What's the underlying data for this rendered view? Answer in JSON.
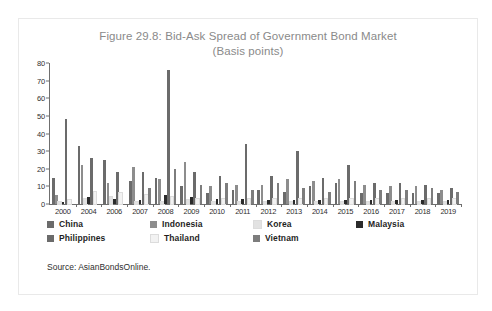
{
  "figure": {
    "title_line1": "Figure 29.8: Bid-Ask Spread of Government Bond Market",
    "title_line2": "(Basis points)",
    "source": "Source: AsianBondsOnline."
  },
  "legend": {
    "rows": [
      [
        {
          "label": "China",
          "color": "#6b6b6b"
        },
        {
          "label": "Indonesia",
          "color": "#8d8d8d"
        },
        {
          "label": "Korea",
          "color": "#e2e2e2"
        },
        {
          "label": "Malaysia",
          "color": "#2b2b2b"
        }
      ],
      [
        {
          "label": "Philippines",
          "color": "#6b6b6b"
        },
        {
          "label": "Thailand",
          "color": "#f2f2f2"
        },
        {
          "label": "Vietnam",
          "color": "#7d7d7d"
        }
      ]
    ]
  },
  "chart_data": {
    "type": "bar",
    "title": "Figure 29.8: Bid-Ask Spread of Government Bond Market (Basis points)",
    "xlabel": "",
    "ylabel": "Basis points",
    "ylim": [
      0,
      80
    ],
    "yticks": [
      0,
      10,
      20,
      30,
      40,
      50,
      60,
      70,
      80
    ],
    "grid": false,
    "legend_position": "below",
    "categories": [
      "2000",
      "2004",
      "2006",
      "2007",
      "2008",
      "2009",
      "2010",
      "2011",
      "2012",
      "2013",
      "2014",
      "2015",
      "2016",
      "2017",
      "2018",
      "2019"
    ],
    "series": [
      {
        "name": "China",
        "color": "#6b6b6b",
        "values": [
          15,
          33,
          25,
          13,
          15,
          10,
          6,
          8,
          8,
          7,
          10,
          12,
          6,
          6,
          6,
          6
        ]
      },
      {
        "name": "Indonesia",
        "color": "#8d8d8d",
        "values": [
          5,
          22,
          12,
          21,
          14,
          24,
          10,
          11,
          11,
          14,
          13,
          14,
          11,
          10,
          10,
          8
        ]
      },
      {
        "name": "Korea",
        "color": "#e2e2e2",
        "values": [
          1,
          3,
          4,
          1,
          1,
          2,
          1,
          1,
          1,
          1,
          1,
          1,
          1,
          1,
          1,
          1
        ]
      },
      {
        "name": "Malaysia",
        "color": "#2b2b2b",
        "values": [
          1,
          4,
          3,
          2,
          5,
          4,
          3,
          3,
          2,
          2,
          2,
          2,
          2,
          2,
          2,
          2
        ]
      },
      {
        "name": "Philippines",
        "color": "#6b6b6b",
        "values": [
          48,
          26,
          18,
          18,
          76,
          18,
          16,
          34,
          16,
          30,
          15,
          22,
          12,
          12,
          11,
          9
        ]
      },
      {
        "name": "Thailand",
        "color": "#f2f2f2",
        "values": [
          2,
          7,
          6,
          5,
          4,
          3,
          3,
          3,
          3,
          3,
          3,
          3,
          3,
          3,
          3,
          3
        ]
      },
      {
        "name": "Vietnam",
        "color": "#7d7d7d",
        "values": [
          0,
          0,
          0,
          9,
          20,
          11,
          12,
          8,
          12,
          9,
          7,
          13,
          8,
          8,
          9,
          7
        ]
      }
    ]
  }
}
